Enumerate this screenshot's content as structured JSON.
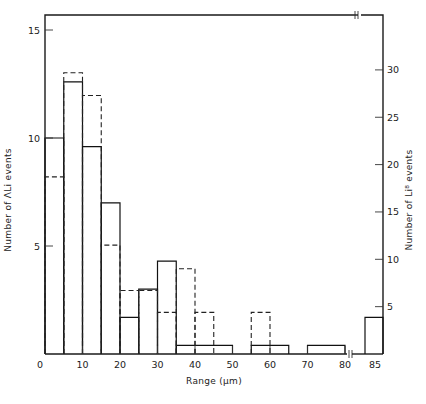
{
  "chart_data": {
    "type": "bar",
    "subtype": "histogram",
    "title": "",
    "xlabel": "Range (µm)",
    "ylabel_left": "Number of ΛLi events",
    "ylabel_right": "Number of Li⁸ events",
    "x_ticks": [
      "0",
      "10",
      "20",
      "30",
      "40",
      "50",
      "60",
      "70",
      "80",
      "85"
    ],
    "y_left_ticks": [
      "5",
      "10",
      "15"
    ],
    "y_right_ticks": [
      "5",
      "10",
      "15",
      "20",
      "25",
      "30"
    ],
    "xlim": [
      0,
      85
    ],
    "ylim_left": [
      0,
      15.5
    ],
    "ylim_right": [
      0,
      36
    ],
    "x_axis_break_after": 80,
    "grid": false,
    "legend": "none",
    "series": [
      {
        "name": "ΛLi events (solid, left axis)",
        "style": "solid",
        "axis": "left",
        "bins": [
          {
            "from": 0,
            "to": 5,
            "value": 10
          },
          {
            "from": 5,
            "to": 10,
            "value": 12.6
          },
          {
            "from": 10,
            "to": 15,
            "value": 9.6
          },
          {
            "from": 15,
            "to": 20,
            "value": 7
          },
          {
            "from": 20,
            "to": 25,
            "value": 1.7
          },
          {
            "from": 25,
            "to": 30,
            "value": 3
          },
          {
            "from": 30,
            "to": 35,
            "value": 4.3
          },
          {
            "from": 35,
            "to": 50,
            "value": 0.4
          },
          {
            "from": 50,
            "to": 55,
            "value": 0
          },
          {
            "from": 55,
            "to": 65,
            "value": 0.4
          },
          {
            "from": 65,
            "to": 70,
            "value": 0
          },
          {
            "from": 70,
            "to": 80,
            "value": 0.4
          },
          {
            "from": "85+",
            "to": "",
            "value": 1.7
          }
        ]
      },
      {
        "name": "Li⁸ events (dashed, right axis)",
        "style": "dashed",
        "axis": "right",
        "bins": [
          {
            "from": 0,
            "to": 5,
            "value": 18.7
          },
          {
            "from": 5,
            "to": 10,
            "value": 29.7
          },
          {
            "from": 10,
            "to": 15,
            "value": 27.3
          },
          {
            "from": 15,
            "to": 20,
            "value": 11.5
          },
          {
            "from": 20,
            "to": 25,
            "value": 6.7
          },
          {
            "from": 25,
            "to": 30,
            "value": 6.7
          },
          {
            "from": 30,
            "to": 35,
            "value": 4.4
          },
          {
            "from": 35,
            "to": 40,
            "value": 9
          },
          {
            "from": 40,
            "to": 45,
            "value": 4.4
          },
          {
            "from": 45,
            "to": 55,
            "value": 0
          },
          {
            "from": 55,
            "to": 60,
            "value": 4.4
          }
        ]
      }
    ]
  }
}
